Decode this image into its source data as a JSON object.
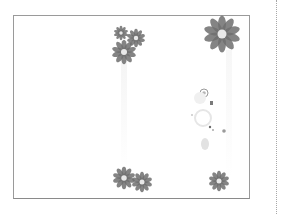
{
  "document": {
    "type": "blank-page-thumbnail",
    "decoration": "grayscale daisy flower corners",
    "frame": {
      "left": 13,
      "top": 15,
      "width": 237,
      "height": 184,
      "border_color": "#9a9a9a"
    },
    "divider": {
      "style": "dotted",
      "x": 276,
      "color": "#a8a8a8"
    }
  },
  "flowers": [
    {
      "name": "flower-top-left-small-1",
      "cx": 121,
      "cy": 33,
      "r": 7
    },
    {
      "name": "flower-top-left-small-2",
      "cx": 136,
      "cy": 38,
      "r": 9
    },
    {
      "name": "flower-top-left-large",
      "cx": 124,
      "cy": 52,
      "r": 12
    },
    {
      "name": "flower-top-right-large",
      "cx": 222,
      "cy": 34,
      "r": 18
    },
    {
      "name": "flower-bottom-left-1",
      "cx": 124,
      "cy": 178,
      "r": 11
    },
    {
      "name": "flower-bottom-left-2",
      "cx": 142,
      "cy": 182,
      "r": 10
    },
    {
      "name": "flower-bottom-right",
      "cx": 219,
      "cy": 181,
      "r": 10
    }
  ],
  "colors": {
    "flower": "#6f6f6f",
    "flower_center": "#e8e8e8",
    "frame": "#9a9a9a",
    "background": "#ffffff"
  }
}
